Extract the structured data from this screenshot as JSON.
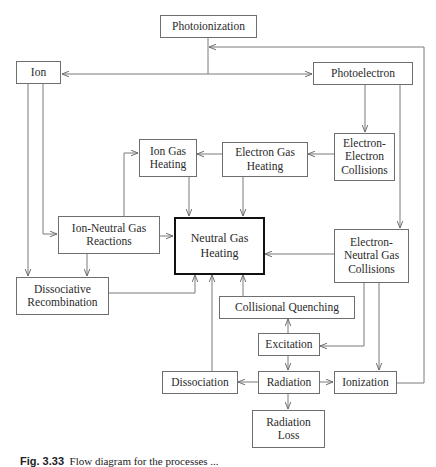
{
  "diagram": {
    "type": "flow diagram",
    "nodes": {
      "photoionization": {
        "lines": [
          "Photoionization"
        ]
      },
      "ion": {
        "lines": [
          "Ion"
        ]
      },
      "photoelectron": {
        "lines": [
          "Photoelectron"
        ]
      },
      "ion_gas_heating": {
        "lines": [
          "Ion Gas",
          "Heating"
        ]
      },
      "electron_gas_heating": {
        "lines": [
          "Electron Gas",
          "Heating"
        ]
      },
      "electron_electron_collisions": {
        "lines": [
          "Electron-",
          "Electron",
          "Collisions"
        ]
      },
      "ion_neutral_gas_reactions": {
        "lines": [
          "Ion-Neutral Gas",
          "Reactions"
        ]
      },
      "neutral_gas_heating": {
        "lines": [
          "Neutral Gas",
          "Heating"
        ],
        "emphasis": "bold border"
      },
      "electron_neutral_gas_collisions": {
        "lines": [
          "Electron-",
          "Neutral Gas",
          "Collisions"
        ]
      },
      "dissociative_recombination": {
        "lines": [
          "Dissociative",
          "Recombination"
        ]
      },
      "collisional_quenching": {
        "lines": [
          "Collisional Quenching"
        ]
      },
      "excitation": {
        "lines": [
          "Excitation"
        ]
      },
      "dissociation": {
        "lines": [
          "Dissociation"
        ]
      },
      "radiation": {
        "lines": [
          "Radiation"
        ]
      },
      "ionization": {
        "lines": [
          "Ionization"
        ]
      },
      "radiation_loss": {
        "lines": [
          "Radiation",
          "Loss"
        ]
      }
    },
    "edges": [
      {
        "from": "Photoionization",
        "to": "Ion"
      },
      {
        "from": "Photoionization",
        "to": "Photoelectron"
      },
      {
        "from": "Ionization",
        "to": "Photoionization"
      },
      {
        "from": "Ion",
        "to": "Ion-Neutral Gas Reactions"
      },
      {
        "from": "Ion",
        "to": "Dissociative Recombination"
      },
      {
        "from": "Photoelectron",
        "to": "Electron-Electron Collisions"
      },
      {
        "from": "Photoelectron",
        "to": "Electron-Neutral Gas Collisions"
      },
      {
        "from": "Electron-Electron Collisions",
        "to": "Electron Gas Heating"
      },
      {
        "from": "Electron Gas Heating",
        "to": "Ion Gas Heating"
      },
      {
        "from": "Electron Gas Heating",
        "to": "Neutral Gas Heating"
      },
      {
        "from": "Ion Gas Heating",
        "to": "Neutral Gas Heating"
      },
      {
        "from": "Ion-Neutral Gas Reactions",
        "to": "Ion Gas Heating"
      },
      {
        "from": "Ion-Neutral Gas Reactions",
        "to": "Neutral Gas Heating"
      },
      {
        "from": "Ion-Neutral Gas Reactions",
        "to": "Dissociative Recombination"
      },
      {
        "from": "Dissociative Recombination",
        "to": "Neutral Gas Heating"
      },
      {
        "from": "Electron-Neutral Gas Collisions",
        "to": "Neutral Gas Heating"
      },
      {
        "from": "Electron-Neutral Gas Collisions",
        "to": "Excitation"
      },
      {
        "from": "Electron-Neutral Gas Collisions",
        "to": "Ionization"
      },
      {
        "from": "Collisional Quenching",
        "to": "Neutral Gas Heating"
      },
      {
        "from": "Excitation",
        "to": "Collisional Quenching"
      },
      {
        "from": "Excitation",
        "to": "Radiation"
      },
      {
        "from": "Radiation",
        "to": "Dissociation"
      },
      {
        "from": "Radiation",
        "to": "Ionization"
      },
      {
        "from": "Radiation",
        "to": "Radiation Loss"
      },
      {
        "from": "Dissociation",
        "to": "Neutral Gas Heating"
      }
    ]
  },
  "caption": {
    "label": "Fig. 3.33",
    "text": "Flow diagram for the processes ... (caption truncated at image edge)"
  }
}
